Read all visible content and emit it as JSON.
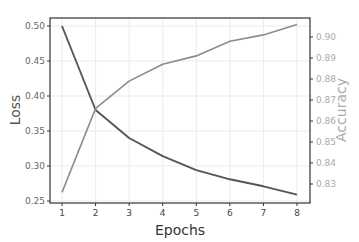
{
  "chart_data": {
    "type": "line",
    "title": "",
    "xlabel": "Epochs",
    "ylabel": "Loss",
    "y2label": "Accuracy",
    "x": [
      1,
      2,
      3,
      4,
      5,
      6,
      7,
      8
    ],
    "x_ticks": [
      "1",
      "2",
      "3",
      "4",
      "5",
      "6",
      "7",
      "8"
    ],
    "ylim": [
      0.25,
      0.51
    ],
    "y_ticks": [
      "0.25",
      "0.30",
      "0.35",
      "0.40",
      "0.45",
      "0.50"
    ],
    "y2lim": [
      0.8235,
      0.9075
    ],
    "y2_ticks": [
      "0.83",
      "0.84",
      "0.85",
      "0.86",
      "0.87",
      "0.88",
      "0.89",
      "0.90"
    ],
    "grid": true,
    "legend": null,
    "series": [
      {
        "name": "Loss",
        "axis": "left",
        "color": "#555555",
        "values": [
          0.5,
          0.38,
          0.34,
          0.314,
          0.294,
          0.281,
          0.271,
          0.259
        ]
      },
      {
        "name": "Accuracy",
        "axis": "right",
        "color": "#8c8c8c",
        "values": [
          0.826,
          0.866,
          0.879,
          0.887,
          0.891,
          0.898,
          0.901,
          0.906
        ]
      }
    ]
  },
  "labels": {
    "x": "Epochs",
    "y_left": "Loss",
    "y_right": "Accuracy"
  }
}
